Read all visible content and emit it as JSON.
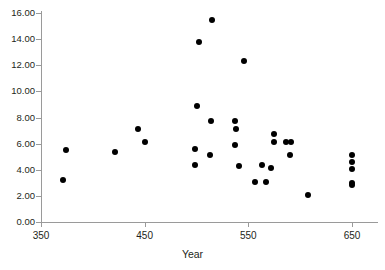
{
  "chart_data": {
    "type": "scatter",
    "title": "",
    "xlabel": "Year",
    "ylabel": "",
    "xlim": [
      350,
      680
    ],
    "ylim": [
      0,
      16
    ],
    "grid": false,
    "legend": null,
    "x_ticks": [
      350,
      450,
      550,
      650
    ],
    "x_tick_labels": [
      "350",
      "450",
      "550",
      "650"
    ],
    "y_ticks": [
      0,
      2,
      4,
      6,
      8,
      10,
      12,
      14,
      16
    ],
    "y_tick_labels": [
      "0.00",
      "2.00",
      "4.00",
      "6.00",
      "8.00",
      "10.00",
      "12.00",
      "14.00",
      "16.00"
    ],
    "marker": "filled-circle",
    "marker_color": "#000000",
    "axis_color": "#9a9a9a",
    "points": [
      {
        "x": 371,
        "y": 3.2
      },
      {
        "x": 374,
        "y": 5.5
      },
      {
        "x": 421,
        "y": 5.35
      },
      {
        "x": 444,
        "y": 7.1
      },
      {
        "x": 450,
        "y": 6.15
      },
      {
        "x": 500,
        "y": 8.85
      },
      {
        "x": 499,
        "y": 5.6
      },
      {
        "x": 499,
        "y": 4.4
      },
      {
        "x": 502,
        "y": 13.75
      },
      {
        "x": 515,
        "y": 15.45
      },
      {
        "x": 514,
        "y": 7.7
      },
      {
        "x": 513,
        "y": 5.1
      },
      {
        "x": 537,
        "y": 7.75
      },
      {
        "x": 538,
        "y": 7.15
      },
      {
        "x": 537,
        "y": 5.9
      },
      {
        "x": 541,
        "y": 4.25
      },
      {
        "x": 546,
        "y": 12.3
      },
      {
        "x": 556,
        "y": 3.05
      },
      {
        "x": 563,
        "y": 4.4
      },
      {
        "x": 567,
        "y": 3.05
      },
      {
        "x": 572,
        "y": 4.1
      },
      {
        "x": 575,
        "y": 6.7
      },
      {
        "x": 575,
        "y": 6.15
      },
      {
        "x": 586,
        "y": 6.15
      },
      {
        "x": 591,
        "y": 6.15
      },
      {
        "x": 590,
        "y": 5.1
      },
      {
        "x": 608,
        "y": 2.1
      },
      {
        "x": 650,
        "y": 5.15
      },
      {
        "x": 650,
        "y": 4.6
      },
      {
        "x": 650,
        "y": 4.05
      },
      {
        "x": 650,
        "y": 3.0
      },
      {
        "x": 650,
        "y": 2.85
      }
    ]
  }
}
